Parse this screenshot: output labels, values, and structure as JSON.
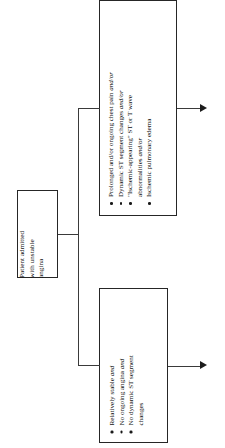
{
  "diagram": {
    "orientation": "rotated-90-ccw",
    "colors": {
      "box_border": "#262626",
      "connector": "#3a3a3a",
      "arrow": "#1c1c1c",
      "background": "#ffffff",
      "text": "#111111"
    }
  },
  "nodes": {
    "start": {
      "label": "Patient admitted with unstable angina",
      "lines": [
        "Patient admitted",
        "with unstable",
        "angina"
      ]
    },
    "high_risk": {
      "items": [
        {
          "text": "Prolonged and/or ongoing chest pain ",
          "emphasis": "and/or",
          "continuation": "",
          "bullet": true
        },
        {
          "text": "Dynamic ST segment changes ",
          "emphasis": "and/or",
          "continuation": "",
          "bullet": true
        },
        {
          "text": "\"Ischemic-appearing\" ST or T wave",
          "emphasis": "",
          "continuation_text": "abnormalities ",
          "continuation_emphasis": "and/or",
          "bullet": true
        },
        {
          "text": "Ischemic pulmonary edema",
          "emphasis": "",
          "continuation": "",
          "bullet": true
        }
      ]
    },
    "low_risk": {
      "items": [
        {
          "text": "Relatively stable ",
          "emphasis": "and",
          "continuation": "",
          "bullet": true
        },
        {
          "text": "No ongoing angina ",
          "emphasis": "and",
          "continuation": "",
          "bullet": true
        },
        {
          "text": "No dynamic ST segment",
          "emphasis": "",
          "continuation_text": "changes",
          "continuation_emphasis": "",
          "bullet": true
        }
      ]
    }
  },
  "connectors": {
    "branch_label": "branch-splitter",
    "arrow_high_label": "arrow-to-high-risk-pathway",
    "arrow_low_label": "arrow-to-low-risk-pathway"
  }
}
